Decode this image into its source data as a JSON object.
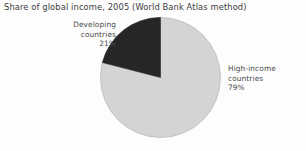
{
  "figure": {
    "title": "Share of global income, 2005 (World Bank Atlas method)",
    "background_color": "#fdfdfd"
  },
  "chart_data": {
    "type": "pie",
    "title": "Share of global income, 2005 (World Bank Atlas method)",
    "xlabel": "",
    "ylabel": "",
    "categories": [
      "Developing countries",
      "High-income countries"
    ],
    "values": [
      21,
      79
    ],
    "value_unit": "%",
    "slices": [
      {
        "name": "Developing countries",
        "label_line1": "Developing",
        "label_line2": "countries",
        "label_value": "21%",
        "value": 21,
        "color": "#262626",
        "start_angle_deg": 284.4,
        "end_angle_deg": 360.0,
        "label_position": "upper-left"
      },
      {
        "name": "High-income countries",
        "label_line1": "High-income",
        "label_line2": "countries",
        "label_value": "79%",
        "value": 79,
        "color": "#d4d4d4",
        "start_angle_deg": 0.0,
        "end_angle_deg": 284.4,
        "label_position": "right"
      }
    ],
    "start_angle_note": "first slice begins at 12 o'clock and sweeps counter-clockwise",
    "legend": "none",
    "grid": false,
    "total": 100
  },
  "colors": {
    "developing_slice": "#262626",
    "high_income_slice": "#d4d4d4",
    "slice_outline": "#b9b9b9",
    "title_text": "#3c3c3c",
    "label_text": "#4a4a4a"
  }
}
